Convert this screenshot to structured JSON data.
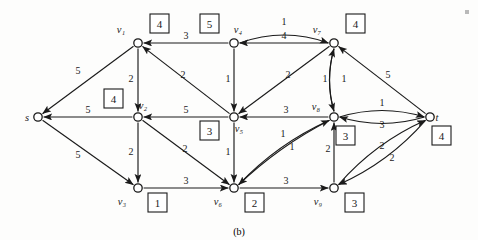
{
  "figure": {
    "caption": "(b)",
    "stroke_color": "#1a1a1a",
    "background_color": "#fdfdfc",
    "page_mark": "■"
  },
  "graph": {
    "nodes": [
      {
        "id": "s",
        "label": "s",
        "x": 38,
        "y": 117,
        "box": null,
        "label_dx": -11,
        "label_dy": 4,
        "box_x": null,
        "box_y": null
      },
      {
        "id": "v1",
        "label": "v₁",
        "x": 138,
        "y": 43,
        "box": "4",
        "label_dx": -17,
        "label_dy": -10,
        "box_x": 150,
        "box_y": 14
      },
      {
        "id": "v2",
        "label": "v₂",
        "x": 138,
        "y": 117,
        "box": "4",
        "label_dx": 5,
        "label_dy": -8,
        "box_x": 104,
        "box_y": 89
      },
      {
        "id": "v3",
        "label": "v₃",
        "x": 138,
        "y": 188,
        "box": "1",
        "label_dx": -16,
        "label_dy": 17,
        "box_x": 148,
        "box_y": 193
      },
      {
        "id": "v4",
        "label": "v₄",
        "x": 234,
        "y": 43,
        "box": "5",
        "label_dx": 4,
        "label_dy": -10,
        "box_x": 200,
        "box_y": 14
      },
      {
        "id": "v5",
        "label": "v₅",
        "x": 234,
        "y": 117,
        "box": "3",
        "label_dx": 5,
        "label_dy": 15,
        "box_x": 200,
        "box_y": 121
      },
      {
        "id": "v6",
        "label": "v₆",
        "x": 234,
        "y": 188,
        "box": "2",
        "label_dx": -16,
        "label_dy": 17,
        "box_x": 245,
        "box_y": 193
      },
      {
        "id": "v7",
        "label": "v₇",
        "x": 334,
        "y": 43,
        "box": "4",
        "label_dx": -17,
        "label_dy": -10,
        "box_x": 346,
        "box_y": 14
      },
      {
        "id": "v8",
        "label": "v₈",
        "x": 334,
        "y": 117,
        "box": "3",
        "label_dx": -18,
        "label_dy": -7,
        "box_x": 336,
        "box_y": 126
      },
      {
        "id": "v9",
        "label": "v₉",
        "x": 334,
        "y": 188,
        "box": "3",
        "label_dx": -16,
        "label_dy": 17,
        "box_x": 345,
        "box_y": 193
      },
      {
        "id": "t",
        "label": "t",
        "x": 430,
        "y": 117,
        "box": "4",
        "label_dx": 7,
        "label_dy": 4,
        "box_x": 432,
        "box_y": 126
      }
    ],
    "edges": [
      {
        "from": "v1",
        "to": "s",
        "capacity": "5",
        "shape": "line",
        "label_x": 78,
        "label_y": 74
      },
      {
        "from": "v2",
        "to": "s",
        "capacity": "5",
        "shape": "line",
        "label_x": 88,
        "label_y": 113
      },
      {
        "from": "s",
        "to": "v3",
        "capacity": "5",
        "shape": "line",
        "label_x": 78,
        "label_y": 158
      },
      {
        "from": "v1",
        "to": "v2",
        "capacity": "2",
        "shape": "line",
        "label_x": 131,
        "label_y": 82
      },
      {
        "from": "v2",
        "to": "v3",
        "capacity": "2",
        "shape": "line",
        "label_x": 131,
        "label_y": 155
      },
      {
        "from": "v4",
        "to": "v1",
        "capacity": "3",
        "shape": "line",
        "label_x": 186,
        "label_y": 39
      },
      {
        "from": "v5",
        "to": "v1",
        "capacity": "2",
        "shape": "line",
        "label_x": 183,
        "label_y": 78
      },
      {
        "from": "v4",
        "to": "v5",
        "capacity": "1",
        "shape": "line",
        "label_x": 228,
        "label_y": 82
      },
      {
        "from": "v5",
        "to": "v2",
        "capacity": "5",
        "shape": "line",
        "label_x": 186,
        "label_y": 113
      },
      {
        "from": "v2",
        "to": "v6",
        "capacity": "2",
        "shape": "line",
        "label_x": 185,
        "label_y": 152
      },
      {
        "from": "v3",
        "to": "v6",
        "capacity": "3",
        "shape": "line",
        "label_x": 186,
        "label_y": 184
      },
      {
        "from": "v5",
        "to": "v6",
        "capacity": "1",
        "shape": "line",
        "label_x": 228,
        "label_y": 155
      },
      {
        "from": "v4",
        "to": "v7",
        "capacity": "1",
        "shape": "curve",
        "label_x": 284,
        "label_y": 25
      },
      {
        "from": "v7",
        "to": "v4",
        "capacity": "4",
        "shape": "line",
        "label_x": 284,
        "label_y": 39
      },
      {
        "from": "v7",
        "to": "v5",
        "capacity": "2",
        "shape": "line",
        "label_x": 288,
        "label_y": 78
      },
      {
        "from": "v8",
        "to": "v5",
        "capacity": "3",
        "shape": "line",
        "label_x": 286,
        "label_y": 113
      },
      {
        "from": "v8",
        "to": "v7",
        "capacity": "1",
        "shape": "curve",
        "label_x": 325,
        "label_y": 82
      },
      {
        "from": "v7",
        "to": "v8",
        "capacity": "1",
        "shape": "curve",
        "label_x": 344,
        "label_y": 82
      },
      {
        "from": "v6",
        "to": "v8",
        "capacity": "1",
        "shape": "curve",
        "label_x": 283,
        "label_y": 137
      },
      {
        "from": "v8",
        "to": "v6",
        "capacity": "1",
        "shape": "curve",
        "label_x": 292,
        "label_y": 150
      },
      {
        "from": "v6",
        "to": "v9",
        "capacity": "3",
        "shape": "line",
        "label_x": 286,
        "label_y": 184
      },
      {
        "from": "v9",
        "to": "v8",
        "capacity": "2",
        "shape": "line",
        "label_x": 328,
        "label_y": 152
      },
      {
        "from": "t",
        "to": "v7",
        "capacity": "5",
        "shape": "line",
        "label_x": 388,
        "label_y": 78
      },
      {
        "from": "v8",
        "to": "t",
        "capacity": "1",
        "shape": "curve",
        "label_x": 382,
        "label_y": 106
      },
      {
        "from": "t",
        "to": "v8",
        "capacity": "3",
        "shape": "curve",
        "label_x": 382,
        "label_y": 128
      },
      {
        "from": "v9",
        "to": "t",
        "capacity": "2",
        "shape": "curve",
        "label_x": 382,
        "label_y": 149
      },
      {
        "from": "t",
        "to": "v9",
        "capacity": "2",
        "shape": "curve",
        "label_x": 392,
        "label_y": 161
      }
    ]
  }
}
